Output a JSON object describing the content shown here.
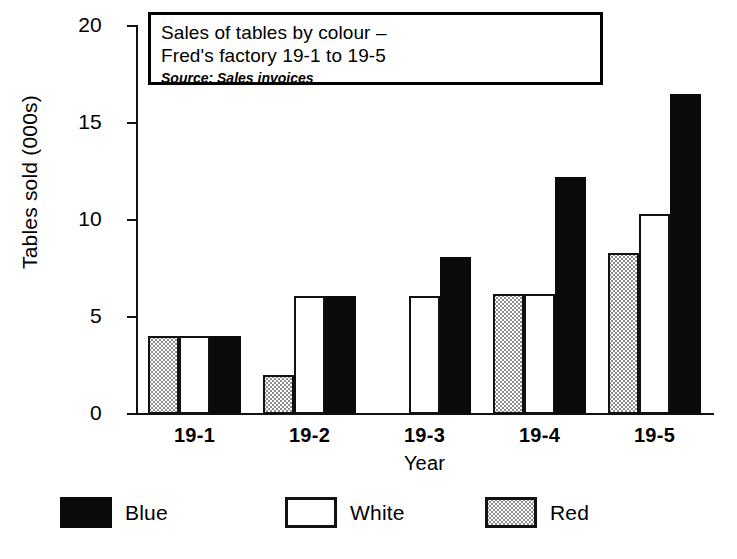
{
  "chart_data": {
    "type": "bar",
    "title": "Sales of tables by colour – Fred's factory 19-1 to 19-5",
    "title_lines": [
      "Sales of tables by colour –",
      "Fred's factory 19-1 to 19-5"
    ],
    "source_note": "Source: Sales invoices",
    "xlabel": "Year",
    "ylabel": "Tables sold (000s)",
    "categories": [
      "19-1",
      "19-2",
      "19-3",
      "19-4",
      "19-5"
    ],
    "ylim": [
      0,
      20
    ],
    "yticks": [
      0,
      5,
      10,
      15,
      20
    ],
    "ytick_labels": [
      "0",
      "5",
      "10",
      "15",
      "20"
    ],
    "grid": false,
    "legend_position": "bottom",
    "series_draw_order": [
      "Red",
      "White",
      "Blue"
    ],
    "series": [
      {
        "name": "Red",
        "fill": "stippled-grey",
        "color": "#d9d9d9",
        "values": [
          4.0,
          2.0,
          0,
          6.2,
          8.3
        ]
      },
      {
        "name": "White",
        "fill": "outline",
        "color": "#ffffff",
        "values": [
          4.0,
          6.1,
          6.1,
          6.2,
          10.3
        ]
      },
      {
        "name": "Blue",
        "fill": "solid-black",
        "color": "#0b0b0b",
        "values": [
          4.0,
          6.1,
          8.1,
          12.2,
          16.5
        ]
      }
    ],
    "legend": [
      {
        "label": "Blue",
        "swatch": "solid-black"
      },
      {
        "label": "White",
        "swatch": "outline"
      },
      {
        "label": "Red",
        "swatch": "stippled-grey"
      }
    ]
  }
}
